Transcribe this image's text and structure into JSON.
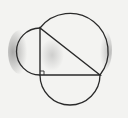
{
  "diagram": {
    "title": "",
    "colors": {
      "background": "#f3f3f1",
      "stroke": "#2a2a2a",
      "shading": "#9a9a9a"
    },
    "triangle": {
      "vertices": {
        "right_angle": [
          40,
          75
        ],
        "top": [
          40,
          28
        ],
        "right": [
          100,
          75
        ]
      },
      "right_angle_marker": true
    },
    "semicircles": [
      {
        "side": "vertical-leg",
        "center": [
          40,
          51.5
        ],
        "radius": 23.5,
        "direction": "left"
      },
      {
        "side": "horizontal-leg",
        "center": [
          70,
          75
        ],
        "radius": 30,
        "direction": "down"
      },
      {
        "side": "hypotenuse",
        "center": [
          70,
          51.5
        ],
        "radius": 38,
        "direction": "up-right"
      }
    ]
  }
}
